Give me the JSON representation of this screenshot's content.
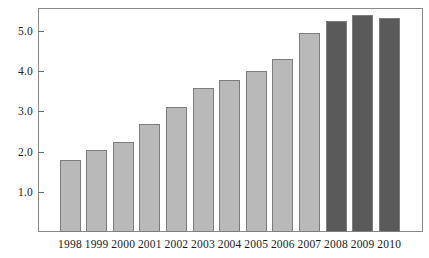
{
  "chart_data": {
    "type": "bar",
    "title": "",
    "subtitle": "",
    "xlabel": "",
    "ylabel": "",
    "categories": [
      "1998",
      "1999",
      "2000",
      "2001",
      "2002",
      "2003",
      "2004",
      "2005",
      "2006",
      "2007",
      "2008",
      "2009",
      "2010"
    ],
    "values": [
      1.78,
      2.05,
      2.25,
      2.68,
      3.1,
      3.58,
      3.78,
      4.0,
      4.3,
      4.95,
      5.25,
      5.4,
      5.32
    ],
    "bar_colors": [
      "#b9b9b9",
      "#b9b9b9",
      "#b9b9b9",
      "#b9b9b9",
      "#b9b9b9",
      "#b9b9b9",
      "#b9b9b9",
      "#b9b9b9",
      "#b9b9b9",
      "#b9b9b9",
      "#5a5a5a",
      "#5a5a5a",
      "#5a5a5a"
    ],
    "ylim": [
      0,
      5.58
    ],
    "ytick_values": [
      1.0,
      2.0,
      3.0,
      4.0,
      5.0
    ],
    "ytick_labels": [
      "1.0",
      "2.0",
      "3.0",
      "4.0",
      "5.0"
    ],
    "grid": false,
    "legend": null,
    "colors": {
      "series_light": "#b9b9b9",
      "series_dark": "#5a5a5a",
      "bar_outline": "#7d7d7d",
      "axis": "#8a8a8a",
      "text": "#1a1a1a",
      "background": "#ffffff"
    }
  }
}
